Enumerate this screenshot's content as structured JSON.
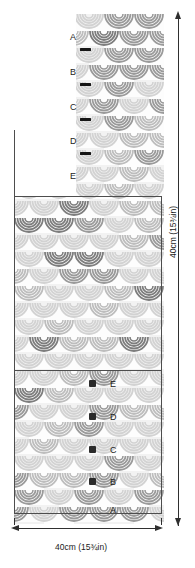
{
  "diagram": {
    "type": "knitting-pattern-schematic",
    "dimensions": {
      "height_label": "40cm (15¾in)",
      "width_label": "40cm (15¾in)"
    },
    "section_labels_top": [
      {
        "letter": "A",
        "has_marker": true,
        "marker": "bar"
      },
      {
        "letter": "B",
        "has_marker": true,
        "marker": "bar"
      },
      {
        "letter": "C",
        "has_marker": true,
        "marker": "bar"
      },
      {
        "letter": "D",
        "has_marker": true,
        "marker": "bar"
      },
      {
        "letter": "E",
        "has_marker": false,
        "marker": "none"
      }
    ],
    "section_labels_bottom": [
      {
        "letter": "E",
        "has_marker": true,
        "marker": "square"
      },
      {
        "letter": "D",
        "has_marker": true,
        "marker": "square"
      },
      {
        "letter": "C",
        "has_marker": true,
        "marker": "square"
      },
      {
        "letter": "B",
        "has_marker": true,
        "marker": "square"
      },
      {
        "letter": "A",
        "has_marker": false,
        "marker": "none"
      }
    ],
    "colors": {
      "fabric_light": "#e8e8e8",
      "fabric_mid": "#c9c9c9",
      "fabric_dark": "#a8a8a8",
      "fabric_darkest": "#8f8f8f",
      "outline": "#4d4d4d",
      "arrow": "#2f2f2f",
      "text": "#1c1c1c",
      "background": "#ffffff"
    },
    "icons": {
      "arrow_up": "arrow-up-icon",
      "arrow_down": "arrow-down-icon",
      "arrow_left": "arrow-left-icon",
      "arrow_right": "arrow-right-icon"
    }
  }
}
